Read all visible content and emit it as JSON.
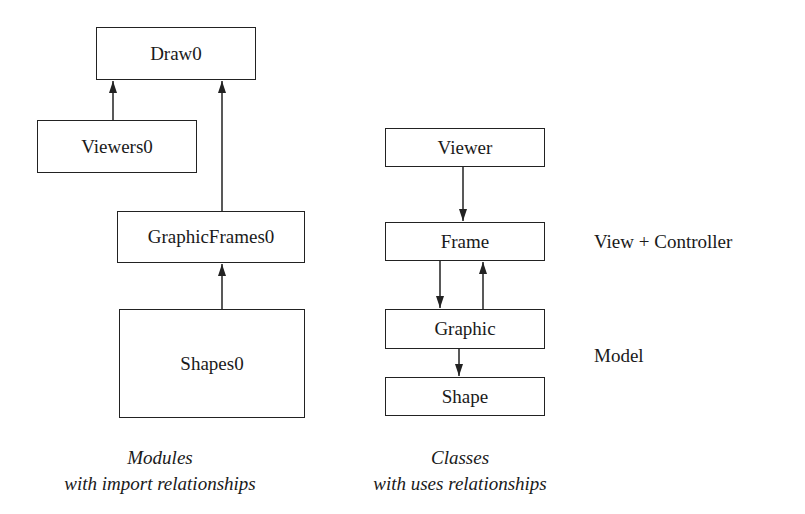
{
  "modules_diagram": {
    "nodes": [
      {
        "id": "draw0",
        "label": "Draw0"
      },
      {
        "id": "viewers0",
        "label": "Viewers0"
      },
      {
        "id": "graphicframes0",
        "label": "GraphicFrames0"
      },
      {
        "id": "shapes0",
        "label": "Shapes0"
      }
    ],
    "edges": [
      {
        "from": "Viewers0",
        "to": "Draw0",
        "relation": "imports"
      },
      {
        "from": "GraphicFrames0",
        "to": "Draw0",
        "relation": "imports"
      },
      {
        "from": "Shapes0",
        "to": "GraphicFrames0",
        "relation": "imports"
      }
    ],
    "caption": {
      "line1": "Modules",
      "line2": "with import relationships"
    }
  },
  "classes_diagram": {
    "nodes": [
      {
        "id": "viewer",
        "label": "Viewer"
      },
      {
        "id": "frame",
        "label": "Frame"
      },
      {
        "id": "graphic",
        "label": "Graphic"
      },
      {
        "id": "shape",
        "label": "Shape"
      }
    ],
    "edges": [
      {
        "from": "Viewer",
        "to": "Frame",
        "relation": "uses"
      },
      {
        "from": "Frame",
        "to": "Graphic",
        "relation": "uses"
      },
      {
        "from": "Graphic",
        "to": "Frame",
        "relation": "uses"
      },
      {
        "from": "Graphic",
        "to": "Shape",
        "relation": "uses"
      }
    ],
    "caption": {
      "line1": "Classes",
      "line2": "with uses relationships"
    }
  },
  "layer_labels": {
    "view_controller": "View + Controller",
    "model": "Model"
  },
  "colors": {
    "stroke": "#222222",
    "background": "#ffffff"
  }
}
